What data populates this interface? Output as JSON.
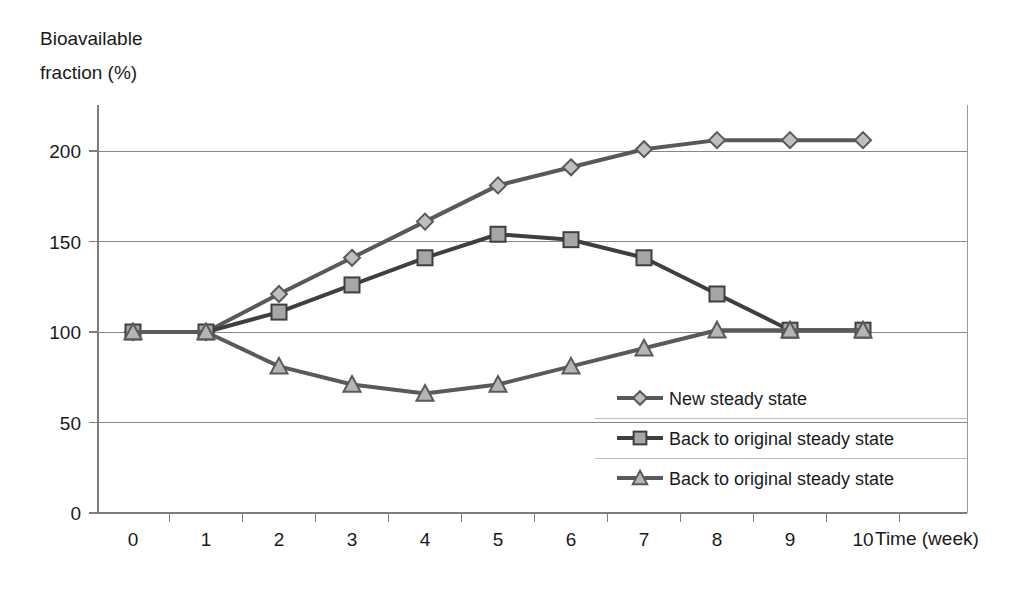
{
  "chart_data": {
    "type": "line",
    "title": "",
    "xlabel": "Time (week)",
    "ylabel": "Bioavailable fraction (%)",
    "ylabel_line1": "Bioavailable",
    "ylabel_line2": "fraction (%)",
    "x": [
      0,
      1,
      2,
      3,
      4,
      5,
      6,
      7,
      8,
      9,
      10
    ],
    "xtick_labels": [
      "0",
      "1",
      "2",
      "3",
      "4",
      "5",
      "6",
      "7",
      "8",
      "9",
      "10"
    ],
    "ytick_labels": [
      "0",
      "50",
      "100",
      "150",
      "200"
    ],
    "yticks": [
      0,
      50,
      100,
      150,
      200
    ],
    "xlim": [
      0,
      10
    ],
    "ylim": [
      0,
      230
    ],
    "grid": true,
    "legend_position": "inside-right-lower",
    "series": [
      {
        "name": "New steady state",
        "marker": "diamond",
        "color": "#595959",
        "marker_fill": "#bfbfbf",
        "values": [
          100,
          100,
          121,
          141,
          161,
          181,
          191,
          201,
          206,
          206,
          206
        ]
      },
      {
        "name": "Back to original steady state",
        "marker": "square",
        "color": "#3f3f3f",
        "marker_fill": "#a6a6a6",
        "values": [
          100,
          100,
          111,
          126,
          141,
          154,
          151,
          141,
          121,
          101,
          101
        ]
      },
      {
        "name": "Back to original steady state",
        "marker": "triangle",
        "color": "#5a5a5a",
        "marker_fill": "#b5b5b5",
        "values": [
          100,
          100,
          81,
          71,
          66,
          71,
          81,
          91,
          101,
          101,
          101
        ]
      }
    ]
  },
  "legend": {
    "items": [
      {
        "label": "New steady state",
        "marker": "diamond"
      },
      {
        "label": "Back to original steady state",
        "marker": "square"
      },
      {
        "label": "Back to original steady state",
        "marker": "triangle"
      }
    ]
  }
}
